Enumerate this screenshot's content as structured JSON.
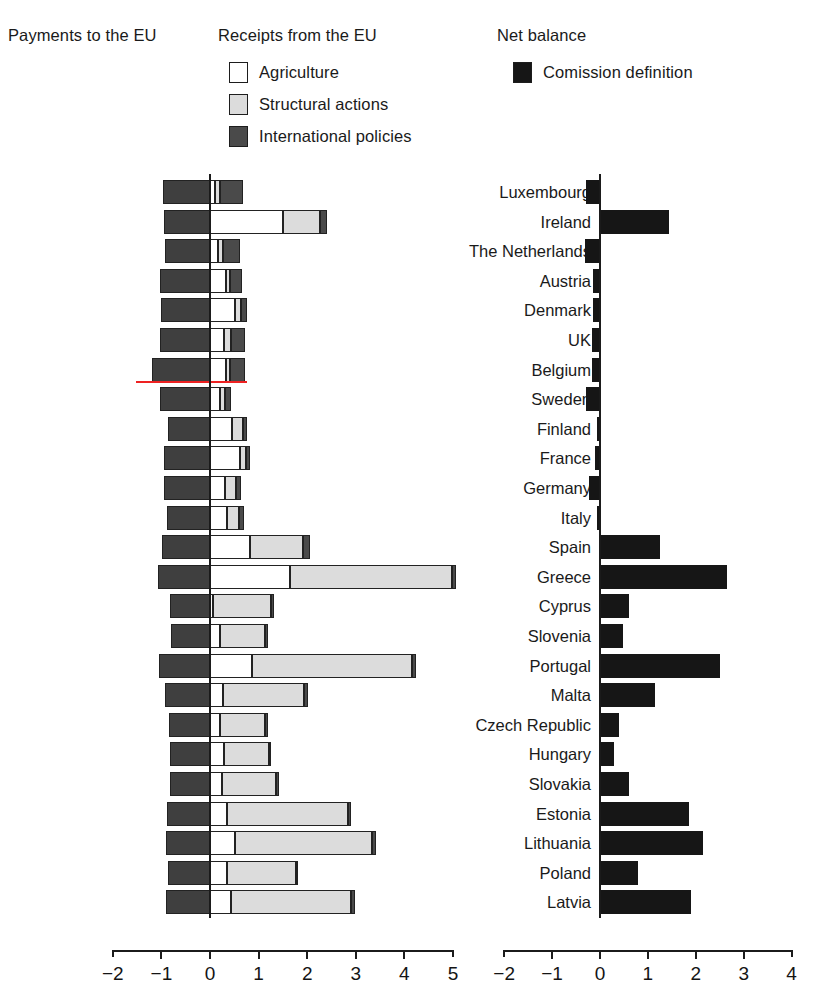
{
  "legend": {
    "headings": {
      "payments": "Payments to the EU",
      "receipts": "Receipts from the EU",
      "net": "Net balance"
    },
    "items": {
      "agriculture": "Agriculture",
      "structural": "Structural actions",
      "international": "International policies",
      "commission": "Comission definition"
    },
    "colors": {
      "agriculture": "#ffffff",
      "structural": "#dcdcdc",
      "international": "#4a4a4a",
      "payments": "#3f3f3f",
      "net": "#161616",
      "highlight": "#ee2222"
    }
  },
  "chart_data": {
    "type": "bar",
    "title": "",
    "subtitle": "",
    "orientation": "horizontal",
    "panels": [
      {
        "name": "payments-receipts",
        "xlabel": "",
        "ylabel": "",
        "xlim": [
          -2,
          5
        ],
        "xticks": [
          -2,
          -1,
          0,
          1,
          2,
          3,
          4,
          5
        ],
        "xtick_labels": [
          "−2",
          "−1",
          "0",
          "1",
          "2",
          "3",
          "4",
          "5"
        ],
        "grid": false,
        "stacked": true,
        "series": [
          {
            "name": "Payments to the EU",
            "direction": "negative"
          },
          {
            "name": "Agriculture",
            "direction": "positive"
          },
          {
            "name": "Structural actions",
            "direction": "positive"
          },
          {
            "name": "International policies",
            "direction": "positive"
          }
        ]
      },
      {
        "name": "net-balance",
        "xlabel": "",
        "ylabel": "",
        "xlim": [
          -2,
          4
        ],
        "xticks": [
          -2,
          -1,
          0,
          1,
          2,
          3,
          4
        ],
        "xtick_labels": [
          "−2",
          "−1",
          "0",
          "1",
          "2",
          "3",
          "4"
        ],
        "grid": false,
        "series": [
          {
            "name": "Comission definition"
          }
        ]
      }
    ],
    "categories": [
      "Luxembourg",
      "Ireland",
      "The Netherlands",
      "Austria",
      "Denmark",
      "UK",
      "Belgium",
      "Sweden",
      "Finland",
      "France",
      "Germany",
      "Italy",
      "Spain",
      "Greece",
      "Cyprus",
      "Slovenia",
      "Portugal",
      "Malta",
      "Czech Republic",
      "Hungary",
      "Slovakia",
      "Estonia",
      "Lithuania",
      "Poland",
      "Latvia"
    ],
    "rows": [
      {
        "country": "Luxembourg",
        "payments": -0.97,
        "agriculture": 0.1,
        "structural": 0.1,
        "international": 0.48,
        "net": -0.29,
        "highlight": false
      },
      {
        "country": "Ireland",
        "payments": -0.95,
        "agriculture": 1.5,
        "structural": 0.76,
        "international": 0.14,
        "net": 1.45,
        "highlight": false
      },
      {
        "country": "The Netherlands",
        "payments": -0.92,
        "agriculture": 0.17,
        "structural": 0.1,
        "international": 0.34,
        "net": -0.31,
        "highlight": false
      },
      {
        "country": "Austria",
        "payments": -1.03,
        "agriculture": 0.32,
        "structural": 0.1,
        "international": 0.24,
        "net": -0.15,
        "highlight": false
      },
      {
        "country": "Denmark",
        "payments": -1.01,
        "agriculture": 0.52,
        "structural": 0.12,
        "international": 0.12,
        "net": -0.14,
        "highlight": false
      },
      {
        "country": "UK",
        "payments": -1.02,
        "agriculture": 0.29,
        "structural": 0.14,
        "international": 0.3,
        "net": -0.16,
        "highlight": false
      },
      {
        "country": "Belgium",
        "payments": -1.2,
        "agriculture": 0.33,
        "structural": 0.08,
        "international": 0.31,
        "net": -0.16,
        "highlight": true
      },
      {
        "country": "Sweden",
        "payments": -1.03,
        "agriculture": 0.21,
        "structural": 0.1,
        "international": 0.12,
        "net": -0.29,
        "highlight": false
      },
      {
        "country": "Finland",
        "payments": -0.86,
        "agriculture": 0.46,
        "structural": 0.21,
        "international": 0.1,
        "net": -0.06,
        "highlight": false
      },
      {
        "country": "France",
        "payments": -0.94,
        "agriculture": 0.62,
        "structural": 0.12,
        "international": 0.08,
        "net": -0.11,
        "highlight": false
      },
      {
        "country": "Germany",
        "payments": -0.95,
        "agriculture": 0.31,
        "structural": 0.22,
        "international": 0.1,
        "net": -0.22,
        "highlight": false
      },
      {
        "country": "Italy",
        "payments": -0.88,
        "agriculture": 0.36,
        "structural": 0.24,
        "international": 0.09,
        "net": -0.07,
        "highlight": false
      },
      {
        "country": "Spain",
        "payments": -0.98,
        "agriculture": 0.82,
        "structural": 1.1,
        "international": 0.14,
        "net": 1.25,
        "highlight": false
      },
      {
        "country": "Greece",
        "payments": -1.08,
        "agriculture": 1.65,
        "structural": 3.33,
        "international": 0.08,
        "net": 2.65,
        "highlight": false
      },
      {
        "country": "Cyprus",
        "payments": -0.82,
        "agriculture": 0.07,
        "structural": 1.18,
        "international": 0.06,
        "net": 0.6,
        "highlight": false
      },
      {
        "country": "Slovenia",
        "payments": -0.8,
        "agriculture": 0.21,
        "structural": 0.92,
        "international": 0.06,
        "net": 0.48,
        "highlight": false
      },
      {
        "country": "Portugal",
        "payments": -1.05,
        "agriculture": 0.86,
        "structural": 3.3,
        "international": 0.08,
        "net": 2.5,
        "highlight": false
      },
      {
        "country": "Malta",
        "payments": -0.92,
        "agriculture": 0.27,
        "structural": 1.66,
        "international": 0.08,
        "net": 1.15,
        "highlight": false
      },
      {
        "country": "Czech Republic",
        "payments": -0.84,
        "agriculture": 0.21,
        "structural": 0.93,
        "international": 0.05,
        "net": 0.4,
        "highlight": false
      },
      {
        "country": "Hungary",
        "payments": -0.82,
        "agriculture": 0.29,
        "structural": 0.92,
        "international": 0.05,
        "net": 0.3,
        "highlight": false
      },
      {
        "country": "Slovakia",
        "payments": -0.83,
        "agriculture": 0.24,
        "structural": 1.12,
        "international": 0.05,
        "net": 0.6,
        "highlight": false
      },
      {
        "country": "Estonia",
        "payments": -0.88,
        "agriculture": 0.36,
        "structural": 2.48,
        "international": 0.06,
        "net": 1.85,
        "highlight": false
      },
      {
        "country": "Lithuania",
        "payments": -0.9,
        "agriculture": 0.52,
        "structural": 2.82,
        "international": 0.07,
        "net": 2.15,
        "highlight": false
      },
      {
        "country": "Poland",
        "payments": -0.86,
        "agriculture": 0.35,
        "structural": 1.41,
        "international": 0.05,
        "net": 0.8,
        "highlight": false
      },
      {
        "country": "Latvia",
        "payments": -0.9,
        "agriculture": 0.44,
        "structural": 2.46,
        "international": 0.08,
        "net": 1.9,
        "highlight": false
      }
    ]
  }
}
